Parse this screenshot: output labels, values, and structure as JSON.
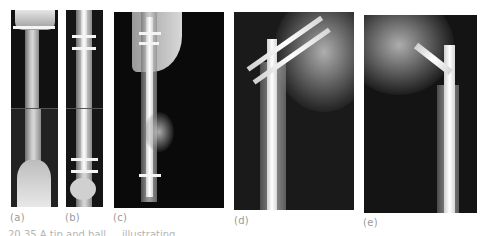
{
  "figure": {
    "panels": [
      {
        "id": "a",
        "label": "(a)",
        "description": "Tibia AP radiograph with proximal transverse screw, distal fracture"
      },
      {
        "id": "b",
        "label": "(b)",
        "description": "Tibia radiograph with intramedullary nail, proximal and distal locking screws"
      },
      {
        "id": "c",
        "label": "(c)",
        "description": "Lateral femur radiograph with intramedullary nail and locking screws"
      },
      {
        "id": "d",
        "label": "(d)",
        "description": "Proximal femur radiograph with nail and two parallel oblique femoral neck screws"
      },
      {
        "id": "e",
        "label": "(e)",
        "description": "Proximal femur radiograph with cephalomedullary nail and single lag screw"
      }
    ],
    "caption": "20.35 A tip and ball ... illustrating ..."
  },
  "colors": {
    "background": "#ffffff",
    "xray_background": "#0d0d0d",
    "label_text": "#9a9a9a"
  }
}
